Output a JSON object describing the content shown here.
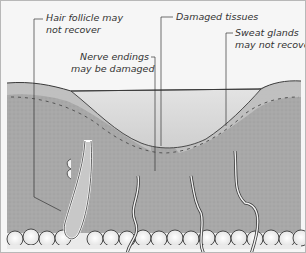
{
  "figure": {
    "colors": {
      "background": "#f6f6f6",
      "dermis": "#a9a9a9",
      "wound": "#dcdcdc",
      "fat": "#ececec",
      "outline": "#3a3a3a"
    }
  },
  "labels": {
    "hair_follicle": {
      "line1": "Hair follicle may",
      "line2": "not recover"
    },
    "nerve_endings": {
      "line1": "Nerve endings",
      "line2": "may be damaged"
    },
    "damaged_tissues": {
      "line1": "Damaged tissues"
    },
    "sweat_glands": {
      "line1": "Sweat glands",
      "line2": "may not recover"
    }
  }
}
